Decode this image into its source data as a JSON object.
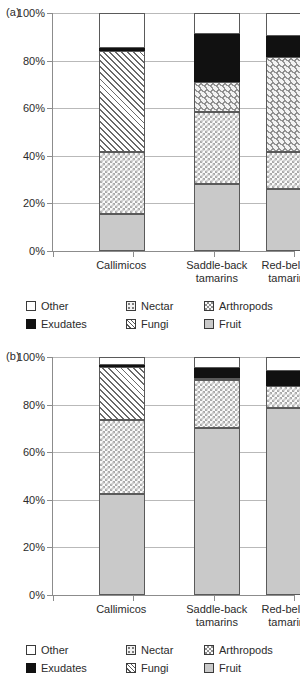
{
  "figure": {
    "panels": [
      {
        "tag": "(a)",
        "categories": [
          "Callimicos",
          "Saddle-back tamarins",
          "Red-bellied tamarins"
        ],
        "category_lines": [
          [
            "Callimicos"
          ],
          [
            "Saddle-back",
            "tamarins"
          ],
          [
            "Red-bellied",
            "tamarins"
          ]
        ],
        "y_ticks": [
          "0%",
          "20%",
          "40%",
          "60%",
          "80%",
          "100%"
        ]
      },
      {
        "tag": "(b)",
        "categories": [
          "Callimicos",
          "Saddle-back tamarins",
          "Red-bellied tamarins"
        ],
        "category_lines": [
          [
            "Callimicos"
          ],
          [
            "Saddle-back",
            "tamarins"
          ],
          [
            "Red-bellied",
            "tamarins"
          ]
        ],
        "y_ticks": [
          "0%",
          "20%",
          "40%",
          "60%",
          "80%",
          "100%"
        ]
      }
    ],
    "legend": {
      "entries": [
        {
          "label": "Other",
          "key": "other",
          "swatch": "other-swatch"
        },
        {
          "label": "Nectar",
          "key": "nectar",
          "swatch": "nectar-swatch"
        },
        {
          "label": "Arthropods",
          "key": "arthropods",
          "swatch": "arthropods-swatch"
        },
        {
          "label": "Exudates",
          "key": "exudates",
          "swatch": "exudates-swatch"
        },
        {
          "label": "Fungi",
          "key": "fungi",
          "swatch": "fungi-swatch"
        },
        {
          "label": "Fruit",
          "key": "fruit",
          "swatch": "fruit-swatch"
        }
      ]
    }
  },
  "chart_data": [
    {
      "type": "bar",
      "stacked": true,
      "panel": "(a)",
      "title": "",
      "xlabel": "",
      "ylabel": "",
      "ylim": [
        0,
        100
      ],
      "yticks": [
        0,
        20,
        40,
        60,
        80,
        100
      ],
      "ytick_labels": [
        "0%",
        "20%",
        "40%",
        "60%",
        "80%",
        "100%"
      ],
      "grid": true,
      "legend_position": "below",
      "categories": [
        "Callimicos",
        "Saddle-back tamarins",
        "Red-bellied tamarins"
      ],
      "series": [
        {
          "name": "Fruit",
          "values": [
            15.5,
            28.0,
            26.0
          ]
        },
        {
          "name": "Arthropods",
          "values": [
            26.0,
            30.5,
            15.5
          ]
        },
        {
          "name": "Nectar",
          "values": [
            0.0,
            12.5,
            40.0
          ]
        },
        {
          "name": "Fungi",
          "values": [
            42.5,
            0.0,
            0.0
          ]
        },
        {
          "name": "Exudates",
          "values": [
            1.5,
            20.0,
            9.0
          ]
        },
        {
          "name": "Other",
          "values": [
            14.5,
            9.0,
            9.5
          ]
        }
      ],
      "cumulative_tops": {
        "Callimicos": {
          "Fruit": 15.5,
          "Arthropods": 41.5,
          "Nectar": 41.5,
          "Fungi": 84.0,
          "Exudates": 85.5,
          "Other": 100
        },
        "Saddle-back tamarins": {
          "Fruit": 28.0,
          "Arthropods": 58.5,
          "Nectar": 71.0,
          "Fungi": 71.0,
          "Exudates": 91.0,
          "Other": 100
        },
        "Red-bellied tamarins": {
          "Fruit": 26.0,
          "Arthropods": 41.5,
          "Nectar": 81.5,
          "Fungi": 81.5,
          "Exudates": 90.5,
          "Other": 100
        }
      }
    },
    {
      "type": "bar",
      "stacked": true,
      "panel": "(b)",
      "title": "",
      "xlabel": "",
      "ylabel": "",
      "ylim": [
        0,
        100
      ],
      "yticks": [
        0,
        20,
        40,
        60,
        80,
        100
      ],
      "ytick_labels": [
        "0%",
        "20%",
        "40%",
        "60%",
        "80%",
        "100%"
      ],
      "grid": true,
      "legend_position": "below",
      "categories": [
        "Callimicos",
        "Saddle-back tamarins",
        "Red-bellied tamarins"
      ],
      "series": [
        {
          "name": "Fruit",
          "values": [
            42.5,
            70.0,
            78.5
          ]
        },
        {
          "name": "Arthropods",
          "values": [
            31.0,
            20.5,
            9.5
          ]
        },
        {
          "name": "Nectar",
          "values": [
            0.0,
            0.5,
            0.0
          ]
        },
        {
          "name": "Fungi",
          "values": [
            22.5,
            0.0,
            0.0
          ]
        },
        {
          "name": "Exudates",
          "values": [
            0.5,
            4.5,
            6.0
          ]
        },
        {
          "name": "Other",
          "values": [
            3.5,
            4.5,
            6.0
          ]
        }
      ],
      "cumulative_tops": {
        "Callimicos": {
          "Fruit": 42.5,
          "Arthropods": 73.5,
          "Nectar": 73.5,
          "Fungi": 96.0,
          "Exudates": 96.5,
          "Other": 100
        },
        "Saddle-back tamarins": {
          "Fruit": 70.0,
          "Arthropods": 90.5,
          "Nectar": 91.0,
          "Fungi": 91.0,
          "Exudates": 95.5,
          "Other": 100
        },
        "Red-bellied tamarins": {
          "Fruit": 78.5,
          "Arthropods": 88.0,
          "Nectar": 88.0,
          "Fungi": 88.0,
          "Exudates": 94.0,
          "Other": 100
        }
      }
    }
  ]
}
